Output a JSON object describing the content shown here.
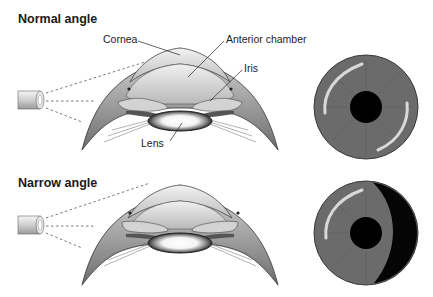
{
  "panels": [
    {
      "title": "Normal angle",
      "labels": {
        "cornea": "Cornea",
        "anterior_chamber": "Anterior chamber",
        "iris": "Iris",
        "lens": "Lens"
      },
      "gonioscopic_view": "open angle — full iris visible"
    },
    {
      "title": "Narrow angle",
      "gonioscopic_view": "narrow angle — iris partly occluded by dark crescent"
    }
  ],
  "colors": {
    "iris": "#6b6b6b",
    "pupil": "#000000",
    "shadow": "#050505",
    "tissue_light": "#e8e8e8",
    "tissue_dark": "#8a8a8a"
  }
}
